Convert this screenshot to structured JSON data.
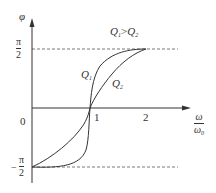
{
  "figure": {
    "y_axis_label": "φ",
    "x_axis_label": {
      "numerator": "ω",
      "denominator": "ω",
      "denominator_sub": "0"
    },
    "origin_label": "0",
    "x_ticks": [
      "1",
      "2"
    ],
    "y_ticks": {
      "top": {
        "sign": "",
        "numerator": "π",
        "denominator": "2"
      },
      "bottom": {
        "sign": "−",
        "numerator": "π",
        "denominator": "2"
      }
    },
    "curve_labels": {
      "q1": {
        "base": "Q",
        "sub": "1"
      },
      "q2": {
        "base": "Q",
        "sub": "2"
      }
    },
    "annotation": {
      "left_base": "Q",
      "left_sub": "1",
      "op": ">",
      "right_base": "Q",
      "right_sub": "2"
    },
    "colors": {
      "ink": "#333333",
      "background": "#ffffff"
    }
  }
}
